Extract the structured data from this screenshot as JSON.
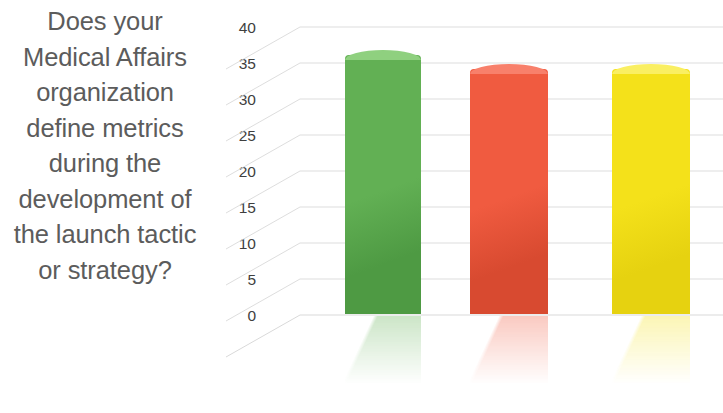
{
  "slide": {
    "background_color": "#ffffff",
    "question": "Does your Medical Affairs organization define metrics during the development of the launch tactic or strategy?",
    "question_color": "#5c5c5c"
  },
  "chart_data": {
    "type": "bar",
    "title": "Does your Medical Affairs organization define metrics during the development of the launch tactic or strategy?",
    "xlabel": "",
    "ylabel": "",
    "ylim": [
      0,
      40
    ],
    "grid": true,
    "legend": "none",
    "style": "3d-column-with-reflection",
    "categories": [
      "Series 1",
      "Series 2",
      "Series 3"
    ],
    "values": [
      36,
      34,
      34
    ],
    "colors": [
      "#62b054",
      "#f05b40",
      "#f4e11a"
    ],
    "y_ticks": [
      {
        "label": "40",
        "value": 40
      },
      {
        "label": "35",
        "value": 35
      },
      {
        "label": "30",
        "value": 30
      },
      {
        "label": "25",
        "value": 25
      },
      {
        "label": "20",
        "value": 20
      },
      {
        "label": "15",
        "value": 15
      },
      {
        "label": "10",
        "value": 10
      },
      {
        "label": "5",
        "value": 5
      },
      {
        "label": "0",
        "value": 0
      }
    ],
    "gridline_color": "#d9d9d9"
  },
  "bars": [
    {
      "name": "green-bar",
      "value": 36,
      "color": "#62b054",
      "color_top": "#8fd07f",
      "color_dark": "#4e9a43"
    },
    {
      "name": "red-bar",
      "value": 34,
      "color": "#f05b40",
      "color_top": "#f8806b",
      "color_dark": "#d84a30"
    },
    {
      "name": "yellow-bar",
      "value": 34,
      "color": "#f4e11a",
      "color_top": "#faef62",
      "color_dark": "#e6d210"
    }
  ]
}
